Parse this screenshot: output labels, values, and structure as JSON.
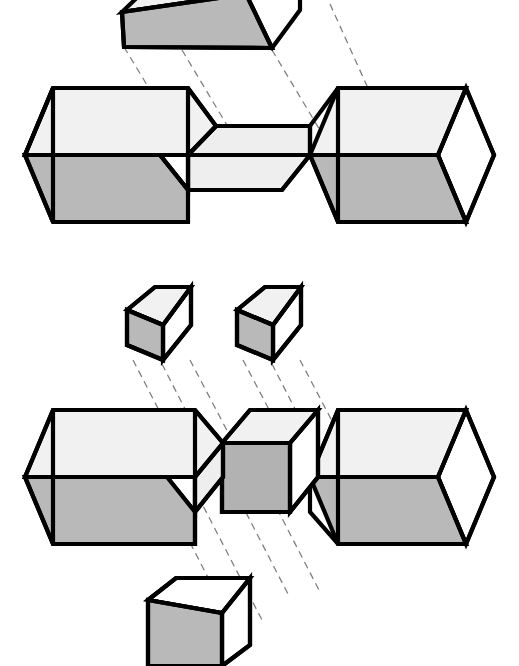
{
  "figure": {
    "background_color": "#ffffff",
    "line_color": "#000000",
    "projection_line_color": "#7d7d7d"
  },
  "palette": {
    "top_face": "#f1f1f1",
    "front_face": "#b9b9b9",
    "side_face": "#ffffff",
    "inner_face": "#eeeeee",
    "dark_front_face": "#b2b2b2"
  },
  "views": [
    {
      "id": "view-upper",
      "name": "upper-assembly",
      "label": "",
      "parts": [
        {
          "id": "upper-key-block",
          "name": "upper-key-block",
          "role": "key",
          "top_face_color": "#f1f1f1",
          "front_face_color": "#b9b9b9",
          "side_face_color": "#ffffff"
        },
        {
          "id": "upper-base-block",
          "name": "upper-notched-base-block",
          "role": "base-with-notch",
          "top_face_color": "#f1f1f1",
          "front_face_color": "#b9b9b9",
          "side_face_color": "#ffffff",
          "notch_face_color": "#eeeeee"
        }
      ],
      "projection_lines": 4
    },
    {
      "id": "view-lower",
      "name": "lower-assembly",
      "label": "",
      "parts": [
        {
          "id": "lower-key-left",
          "name": "lower-key-block-left",
          "role": "key",
          "top_face_color": "#f1f1f1",
          "front_face_color": "#b9b9b9",
          "side_face_color": "#ffffff"
        },
        {
          "id": "lower-key-right",
          "name": "lower-key-block-right",
          "role": "key",
          "top_face_color": "#f1f1f1",
          "front_face_color": "#b9b9b9",
          "side_face_color": "#ffffff"
        },
        {
          "id": "lower-base-left",
          "name": "lower-base-block-left",
          "role": "base-left",
          "top_face_color": "#f1f1f1",
          "front_face_color": "#b9b9b9",
          "side_face_color": "#ffffff"
        },
        {
          "id": "lower-center",
          "name": "lower-center-block",
          "role": "center-core",
          "top_face_color": "#f1f1f1",
          "front_face_color": "#b2b2b2",
          "side_face_color": "#ffffff"
        },
        {
          "id": "lower-base-right",
          "name": "lower-base-block-right",
          "role": "base-right",
          "top_face_color": "#f1f1f1",
          "front_face_color": "#b9b9b9",
          "side_face_color": "#ffffff"
        },
        {
          "id": "lower-drop-block",
          "name": "lower-drop-block",
          "role": "key-below",
          "top_face_color": "#ffffff",
          "front_face_color": "#b9b9b9",
          "side_face_color": "#ffffff"
        }
      ],
      "projection_lines": 8
    }
  ]
}
